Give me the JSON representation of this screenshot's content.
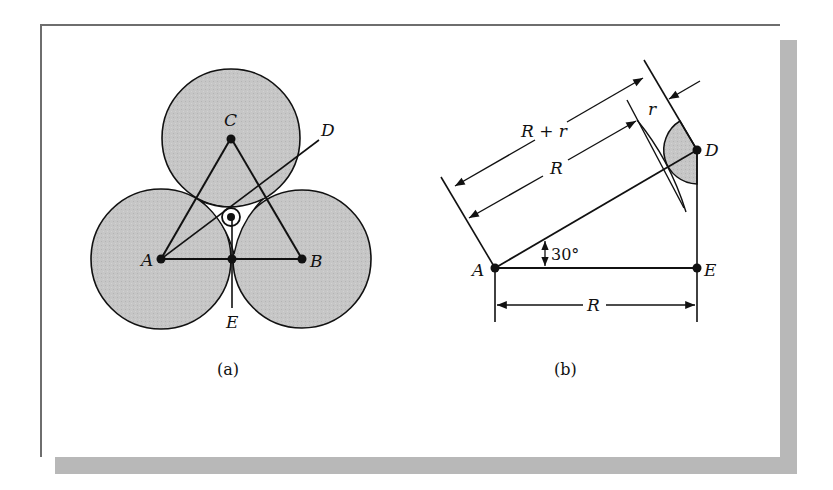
{
  "figure": {
    "panel_a": {
      "caption": "(a)",
      "points": {
        "A": "A",
        "B": "B",
        "C": "C",
        "D": "D",
        "E": "E"
      },
      "fill_color": "#c4c4c4"
    },
    "panel_b": {
      "caption": "(b)",
      "points": {
        "A": "A",
        "D": "D",
        "E": "E"
      },
      "dimensions": {
        "r_plus_R": "R + r",
        "R_slanted": "R",
        "r": "r",
        "R_horizontal": "R"
      },
      "angle": "30°",
      "fill_color": "#c4c4c4"
    }
  }
}
